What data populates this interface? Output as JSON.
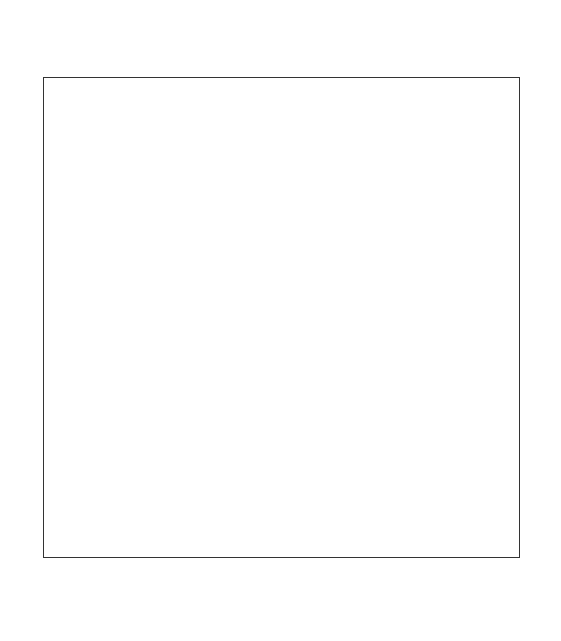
{
  "board": {
    "files": [
      "a",
      "b",
      "c",
      "d",
      "e",
      "f",
      "g",
      "h"
    ],
    "ranks": [
      "8",
      "7",
      "6",
      "5",
      "4",
      "3",
      "2",
      "1"
    ],
    "colors": {
      "light": "#ffffff",
      "dark": "#a6a6a6"
    },
    "pieces": [
      {
        "square": "h8",
        "piece": "king",
        "color": "black",
        "glyph": "♚"
      },
      {
        "square": "g7",
        "piece": "rook",
        "color": "white",
        "glyph": "♖"
      },
      {
        "square": "f6",
        "piece": "king",
        "color": "white",
        "glyph": "♔"
      }
    ]
  },
  "caption": "圖十一"
}
